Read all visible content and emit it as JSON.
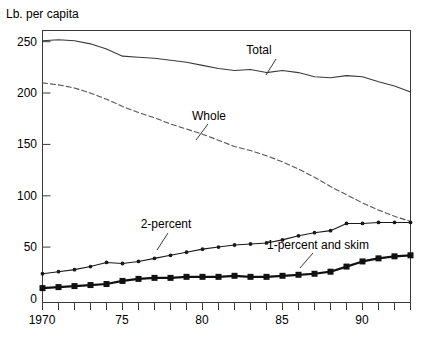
{
  "chart_data": {
    "type": "line",
    "title": "",
    "subtitle": "",
    "xlabel": "",
    "ylabel": "Lb. per capita",
    "xlim": [
      1970,
      1993
    ],
    "ylim": [
      0,
      265
    ],
    "grid": false,
    "legend_position": "inline-annotations",
    "x": [
      1970,
      1971,
      1972,
      1973,
      1974,
      1975,
      1976,
      1977,
      1978,
      1979,
      1980,
      1981,
      1982,
      1983,
      1984,
      1985,
      1986,
      1987,
      1988,
      1989,
      1990,
      1991,
      1992,
      1993
    ],
    "y_ticks": [
      0,
      50,
      100,
      150,
      200,
      250
    ],
    "y_tick_labels": [
      "0",
      "50",
      "100",
      "150",
      "200",
      "250"
    ],
    "x_ticks": [
      1970,
      1971,
      1972,
      1973,
      1974,
      1975,
      1976,
      1977,
      1978,
      1979,
      1980,
      1981,
      1982,
      1983,
      1984,
      1985,
      1986,
      1987,
      1988,
      1989,
      1990,
      1991,
      1992,
      1993
    ],
    "x_tick_labels": [
      "1970",
      "",
      "",
      "",
      "",
      "75",
      "",
      "",
      "",
      "",
      "80",
      "",
      "",
      "",
      "",
      "85",
      "",
      "",
      "",
      "",
      "90",
      "",
      "",
      ""
    ],
    "series": [
      {
        "name": "Total",
        "style": "solid",
        "marker": "none",
        "color": "#3a3a3a",
        "values": [
          255,
          256,
          255,
          252,
          247,
          240,
          239,
          238,
          236,
          234,
          231,
          228,
          226,
          227,
          224,
          226,
          224,
          220,
          219,
          221,
          220,
          215,
          211,
          205
        ]
      },
      {
        "name": "Whole",
        "style": "dashed",
        "marker": "none",
        "color": "#555555",
        "values": [
          214,
          212,
          209,
          204,
          198,
          191,
          185,
          180,
          174,
          169,
          164,
          158,
          152,
          148,
          143,
          137,
          130,
          122,
          113,
          105,
          97,
          90,
          84,
          79
        ]
      },
      {
        "name": "2-percent",
        "style": "solid",
        "marker": "dot",
        "color": "#1a1a1a",
        "values": [
          28,
          30,
          32,
          35,
          39,
          38,
          40,
          43,
          46,
          49,
          52,
          54,
          56,
          57,
          58,
          61,
          65,
          68,
          70,
          77,
          77,
          78,
          78,
          78
        ]
      },
      {
        "name": "1-percent and skim",
        "style": "solid",
        "marker": "square",
        "color": "#111111",
        "values": [
          14,
          15,
          16,
          17,
          18,
          21,
          23,
          24,
          24,
          25,
          25,
          25,
          26,
          25,
          25,
          26,
          27,
          28,
          30,
          35,
          40,
          43,
          45,
          46
        ]
      }
    ],
    "annotations": [
      {
        "text": "Total",
        "series": "Total"
      },
      {
        "text": "Whole",
        "series": "Whole"
      },
      {
        "text": "2-percent",
        "series": "2-percent"
      },
      {
        "text": "1-percent and skim",
        "series": "1-percent and skim"
      }
    ]
  }
}
